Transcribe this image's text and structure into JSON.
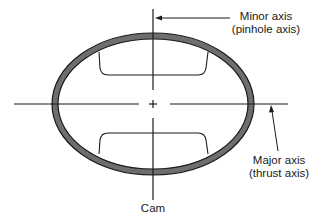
{
  "diagram": {
    "type": "piston-cam-ground-cross-section",
    "labels": {
      "minor_axis": {
        "line1": "Minor axis",
        "line2": "(pinhole axis)"
      },
      "major_axis": {
        "line1": "Major axis",
        "line2": "(thrust axis)"
      },
      "cam": "Cam"
    },
    "colors": {
      "ring_fill": "#6e6e6e",
      "outline": "#1a1a1a",
      "background": "#ffffff"
    },
    "geometry": {
      "center": [
        153,
        104
      ],
      "outer_rx": 101,
      "outer_ry": 71,
      "ring_thickness": 6
    }
  }
}
